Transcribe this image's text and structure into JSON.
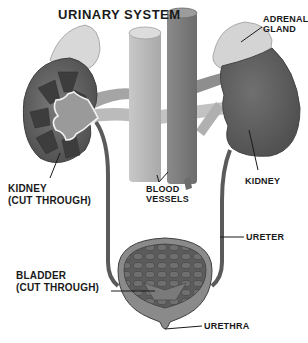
{
  "title": "URINARY SYSTEM",
  "labels": {
    "adrenal_gland": [
      "ADRENAL",
      "GLAND"
    ],
    "kidney_cut": [
      "KIDNEY",
      "(CUT THROUGH)"
    ],
    "blood_vessels": [
      "BLOOD",
      "VESSELS"
    ],
    "kidney": "KIDNEY",
    "ureter": "URETER",
    "bladder_cut": [
      "BLADDER",
      "(CUT THROUGH)"
    ],
    "urethra": "URETHRA"
  },
  "colors": {
    "background": "#ffffff",
    "kidney_dark": "#5a5a5a",
    "kidney_mid": "#6e6e6e",
    "vessel_light": "#b9b9b9",
    "vessel_dark": "#7d7d7d",
    "adrenal": "#d8d8d8",
    "text": "#1a1a1a"
  }
}
